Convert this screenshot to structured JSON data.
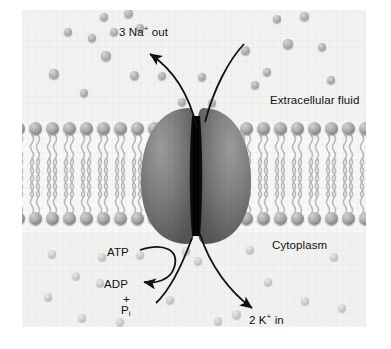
{
  "figure": {
    "regions": {
      "extracellular_label": "Extracellular fluid",
      "cytoplasm_label": "Cytoplasm"
    },
    "labels": {
      "sodium_out": {
        "count": "3",
        "ion": "Na",
        "charge": "+",
        "direction": "out",
        "full": "3 Na+ out"
      },
      "potassium_in": {
        "count": "2",
        "ion": "K",
        "charge": "+",
        "direction": "in",
        "full": "2 K+ in"
      },
      "atp": "ATP",
      "adp": "ADP",
      "plus": "+",
      "phosphate": "P",
      "phosphate_sub": "i"
    },
    "colors": {
      "background": "#f4f4f2",
      "sodium_ion": "#b4b4b2",
      "potassium_ion": "#cfcfcd",
      "lipid_head": "#9a9a98",
      "protein_lobe": "#767676",
      "channel": "#0a0a0a",
      "arrow": "#111111",
      "text": "#111111"
    },
    "ions": {
      "extracellular": [
        {
          "x": 32,
          "y": 64,
          "r": 4.6
        },
        {
          "x": 46,
          "y": 22,
          "r": 4.2
        },
        {
          "x": 70,
          "y": 28,
          "r": 4.4
        },
        {
          "x": 62,
          "y": 83,
          "r": 4.3
        },
        {
          "x": 84,
          "y": 46,
          "r": 4.6
        },
        {
          "x": 92,
          "y": 22,
          "r": 4.0
        },
        {
          "x": 82,
          "y": 7,
          "r": 4.4
        },
        {
          "x": 106,
          "y": 3,
          "r": 4.5
        },
        {
          "x": 118,
          "y": 18,
          "r": 4.4
        },
        {
          "x": 112,
          "y": 65,
          "r": 4.5
        },
        {
          "x": 140,
          "y": 66,
          "r": 4.4
        },
        {
          "x": 160,
          "y": 92,
          "r": 4.3
        },
        {
          "x": 190,
          "y": 93,
          "r": 4.2
        },
        {
          "x": 223,
          "y": 40,
          "r": 4.5
        },
        {
          "x": 245,
          "y": 62,
          "r": 4.4
        },
        {
          "x": 255,
          "y": 9,
          "r": 4.3
        },
        {
          "x": 266,
          "y": 34,
          "r": 4.6
        },
        {
          "x": 282,
          "y": 6,
          "r": 4.5
        },
        {
          "x": 300,
          "y": 37,
          "r": 4.4
        },
        {
          "x": 309,
          "y": 70,
          "r": 4.4
        },
        {
          "x": 233,
          "y": 75,
          "r": 4.0
        },
        {
          "x": 180,
          "y": 67,
          "r": 4.0
        }
      ],
      "cytoplasm": [
        {
          "x": 30,
          "y": 244,
          "r": 4.4
        },
        {
          "x": 54,
          "y": 266,
          "r": 4.1
        },
        {
          "x": 26,
          "y": 287,
          "r": 4.3
        },
        {
          "x": 60,
          "y": 308,
          "r": 4.4
        },
        {
          "x": 98,
          "y": 312,
          "r": 4.2
        },
        {
          "x": 80,
          "y": 247,
          "r": 4.2
        },
        {
          "x": 78,
          "y": 273,
          "r": 4.4
        },
        {
          "x": 148,
          "y": 290,
          "r": 4.3
        },
        {
          "x": 118,
          "y": 245,
          "r": 4.1
        },
        {
          "x": 176,
          "y": 251,
          "r": 4.4
        },
        {
          "x": 164,
          "y": 241,
          "r": 4.0
        },
        {
          "x": 228,
          "y": 240,
          "r": 4.2
        },
        {
          "x": 246,
          "y": 272,
          "r": 4.3
        },
        {
          "x": 214,
          "y": 304,
          "r": 4.5
        },
        {
          "x": 283,
          "y": 291,
          "r": 4.3
        },
        {
          "x": 196,
          "y": 311,
          "r": 4.4
        },
        {
          "x": 312,
          "y": 247,
          "r": 4.2
        },
        {
          "x": 320,
          "y": 298,
          "r": 4.3
        }
      ]
    },
    "membrane": {
      "leaflets": 2,
      "upper_heads_y": 118,
      "lower_heads_y": 208,
      "head_spacing": 17,
      "left_span": [
        -4,
        166
      ],
      "right_span": [
        224,
        348
      ]
    }
  }
}
